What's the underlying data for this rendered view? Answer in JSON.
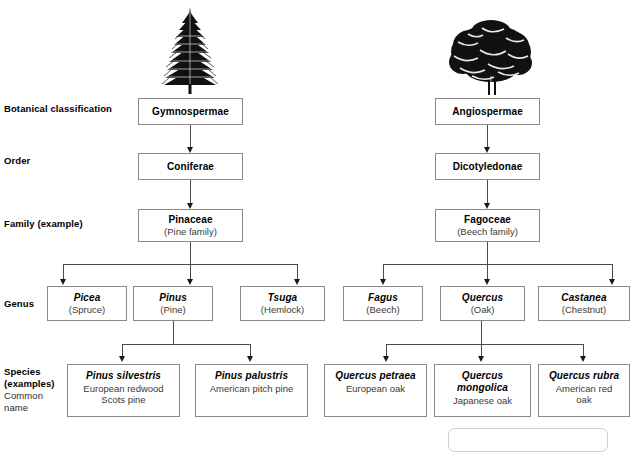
{
  "diagram": {
    "row_labels": [
      {
        "id": "botanical-classification",
        "text": "Botanical classification",
        "sub": ""
      },
      {
        "id": "order",
        "text": "Order",
        "sub": ""
      },
      {
        "id": "family",
        "text": "Family (example)",
        "sub": ""
      },
      {
        "id": "genus",
        "text": "Genus",
        "sub": ""
      },
      {
        "id": "species",
        "text": "Species\n(examples)",
        "sub": "Common\nname"
      }
    ],
    "illustrations": [
      {
        "id": "conifer-tree",
        "name": "conifer-tree-illustration",
        "alt": "Conifer tree silhouette"
      },
      {
        "id": "broadleaf-tree",
        "name": "broadleaf-tree-illustration",
        "alt": "Broadleaf tree silhouette"
      }
    ],
    "branches": {
      "gymnospermae": {
        "classification": {
          "name": "Gymnospermae",
          "common": ""
        },
        "order": {
          "name": "Coniferae",
          "common": ""
        },
        "family": {
          "name": "Pinaceae",
          "common": "(Pine family)"
        },
        "genera": [
          {
            "name": "Picea",
            "common": "(Spruce)"
          },
          {
            "name": "Pinus",
            "common": "(Pine)"
          },
          {
            "name": "Tsuga",
            "common": "(Hemlock)"
          }
        ],
        "species": [
          {
            "name": "Pinus silvestris",
            "common": "European redwood\nScots pine"
          },
          {
            "name": "Pinus palustris",
            "common": "American pitch pine"
          }
        ]
      },
      "angiospermae": {
        "classification": {
          "name": "Angiospermae",
          "common": ""
        },
        "order": {
          "name": "Dicotyledonae",
          "common": ""
        },
        "family": {
          "name": "Fagoceae",
          "common": "(Beech family)"
        },
        "genera": [
          {
            "name": "Fagus",
            "common": "(Beech)"
          },
          {
            "name": "Quercus",
            "common": "(Oak)"
          },
          {
            "name": "Castanea",
            "common": "(Chestnut)"
          }
        ],
        "species": [
          {
            "name": "Quercus petraea",
            "common": "European oak"
          },
          {
            "name": "Quercus mongolica",
            "common": "Japanese oak"
          },
          {
            "name": "Quercus rubra",
            "common": "American red\noak"
          }
        ]
      }
    },
    "colors": {
      "box_border": "#8a8a8a",
      "connector": "#4a4a4a",
      "arrow": "#1a1a1a",
      "text_primary": "#000000",
      "text_secondary": "#3a3a3a",
      "background": "#ffffff"
    }
  }
}
